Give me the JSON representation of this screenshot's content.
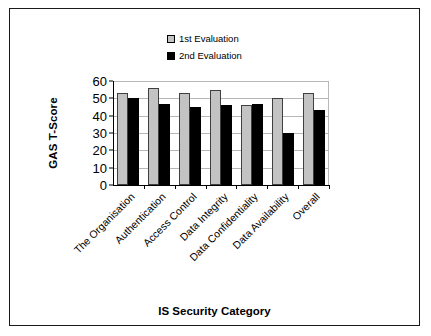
{
  "chart_data": {
    "type": "bar",
    "title": "",
    "xlabel": "IS Security Category",
    "ylabel": "GAS T-Score",
    "categories": [
      "The Organisation",
      "Authentication",
      "Access Control",
      "Data Integrity",
      "Data Confidentiality",
      "Data Availability",
      "Overall"
    ],
    "series": [
      {
        "name": "1st Evaluation",
        "color": "#c3c3c3",
        "values": [
          53,
          56,
          53,
          55,
          46,
          50,
          53
        ]
      },
      {
        "name": "2nd Evaluation",
        "color": "#000000",
        "values": [
          50,
          47,
          45,
          46,
          47,
          30,
          43
        ]
      }
    ],
    "ylim": [
      0,
      60
    ],
    "yticks": [
      0,
      10,
      20,
      30,
      40,
      50,
      60
    ],
    "ytick_labels": [
      "0",
      "10",
      "20",
      "30",
      "40",
      "50",
      "60"
    ],
    "grid": "horizontal",
    "legend_position": "top-center",
    "grouped": true
  },
  "legend": {
    "items": [
      {
        "label": "1st Evaluation",
        "swatch": "legend-swatch-gray"
      },
      {
        "label": "2nd Evaluation",
        "swatch": "legend-swatch-black"
      }
    ]
  }
}
